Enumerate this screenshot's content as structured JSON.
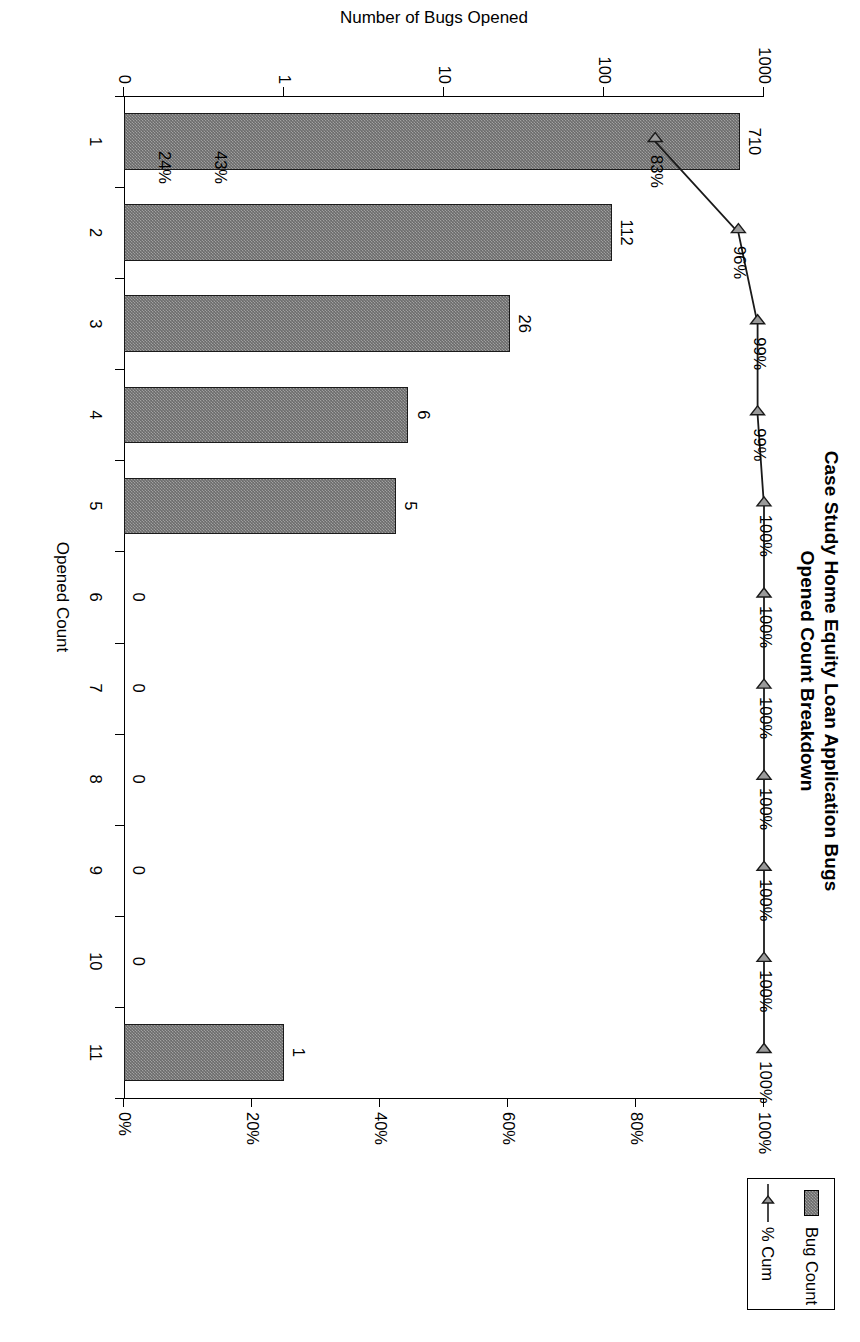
{
  "chart_data": {
    "type": "bar",
    "title": "Case Study Home Equity Loan Application Bugs",
    "subtitle": "Opened Count Breakdown",
    "xlabel": "Opened Count",
    "ylabel": "Number of Bugs Opened",
    "ylabel_right": "",
    "categories": [
      "1",
      "2",
      "3",
      "4",
      "5",
      "6",
      "7",
      "8",
      "9",
      "10",
      "11"
    ],
    "series": [
      {
        "name": "Bug Count",
        "kind": "bar",
        "values": [
          710,
          112,
          26,
          6,
          5,
          0,
          0,
          0,
          0,
          0,
          1
        ],
        "value_labels": [
          "710",
          "112",
          "26",
          "6",
          "5",
          "0",
          "0",
          "0",
          "0",
          "0",
          "1"
        ],
        "color": "#6b6b6b"
      },
      {
        "name": "% Cum",
        "kind": "line",
        "values": [
          83,
          96,
          99,
          99,
          100,
          100,
          100,
          100,
          100,
          100,
          100
        ],
        "value_labels": [
          "83%",
          "96%",
          "99%",
          "99%",
          "100%",
          "100%",
          "100%",
          "100%",
          "100%",
          "100%",
          "100%"
        ],
        "color": "#1a1a1a",
        "marker": "triangle"
      }
    ],
    "extra_labels": [
      {
        "text": "43%",
        "category": "1",
        "note": "annotation near category 1"
      },
      {
        "text": "24%",
        "category": "1",
        "note": "annotation near category 1"
      }
    ],
    "yaxis_left": {
      "scale": "log",
      "ticks": [
        "1000",
        "100",
        "10",
        "1",
        "0"
      ],
      "tick_values": [
        1000,
        100,
        10,
        1,
        0
      ]
    },
    "yaxis_right": {
      "scale": "linear",
      "ticks": [
        "0%",
        "20%",
        "40%",
        "60%",
        "80%",
        "100%"
      ],
      "tick_values": [
        0,
        20,
        40,
        60,
        80,
        100
      ],
      "ylim": [
        0,
        100
      ]
    },
    "grid": false,
    "legend": {
      "position": "top-right",
      "entries": [
        {
          "label": "Bug Count",
          "swatch": "filled-bar"
        },
        {
          "label": "% Cum",
          "swatch": "line-triangle-marker"
        }
      ]
    }
  }
}
